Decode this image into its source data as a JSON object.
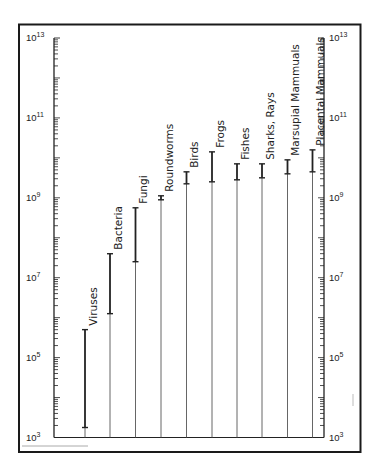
{
  "chart_data": {
    "type": "range-bar",
    "title": "",
    "xlabel": "",
    "ylabel": "",
    "yscale": "log",
    "ylim": [
      1000,
      10000000000000
    ],
    "y_tick_labels": [
      "10^3",
      "10^5",
      "10^7",
      "10^9",
      "10^11",
      "10^13"
    ],
    "y_tick_exponents": [
      3,
      5,
      7,
      9,
      11,
      13
    ],
    "grid": false,
    "legend": null,
    "categories": [
      "Viruses",
      "Bacteria",
      "Fungi",
      "Roundworms",
      "Birds",
      "Frogs",
      "Fishes",
      "Sharks, Rays",
      "Marsupial Mammuals",
      "Placental Mammuals"
    ],
    "ranges_log10": [
      [
        3.25,
        5.7
      ],
      [
        6.1,
        7.6
      ],
      [
        7.4,
        8.75
      ],
      [
        8.95,
        9.05
      ],
      [
        9.35,
        9.65
      ],
      [
        9.4,
        10.15
      ],
      [
        9.45,
        9.85
      ],
      [
        9.5,
        9.85
      ],
      [
        9.6,
        9.95
      ],
      [
        9.65,
        10.2
      ]
    ],
    "ranges": [
      [
        1800,
        500000
      ],
      [
        1250000,
        40000000
      ],
      [
        25000000,
        560000000
      ],
      [
        900000000,
        1100000000
      ],
      [
        2200000000,
        4500000000
      ],
      [
        2500000000,
        14000000000
      ],
      [
        2800000000,
        7000000000
      ],
      [
        3200000000,
        7000000000
      ],
      [
        4000000000,
        9000000000
      ],
      [
        4500000000,
        16000000000
      ]
    ]
  },
  "axis": {
    "left_labels": [
      {
        "base": "10",
        "exp": "13"
      },
      {
        "base": "10",
        "exp": "11"
      },
      {
        "base": "10",
        "exp": "9"
      },
      {
        "base": "10",
        "exp": "7"
      },
      {
        "base": "10",
        "exp": "5"
      },
      {
        "base": "10",
        "exp": "3"
      }
    ],
    "right_labels": [
      {
        "base": "10",
        "exp": "13"
      },
      {
        "base": "10",
        "exp": "11"
      },
      {
        "base": "10",
        "exp": "9"
      },
      {
        "base": "10",
        "exp": "7"
      },
      {
        "base": "10",
        "exp": "5"
      },
      {
        "base": "10",
        "exp": "3"
      }
    ]
  },
  "colors": {
    "frame": "#1a1a1a",
    "axis": "#222222",
    "bar": "#222222",
    "stem": "#555555",
    "faint": "#999999"
  }
}
